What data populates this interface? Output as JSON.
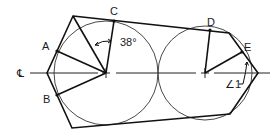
{
  "diagram": {
    "type": "geometric construction — polygon tangent to two circles",
    "centerline_symbol": "℄",
    "points": {
      "A": "A",
      "B": "B",
      "C": "C",
      "D": "D",
      "E": "E"
    },
    "angles": {
      "angle_c": "38°",
      "angle_1": "∠1"
    },
    "colors": {
      "line": "#111111",
      "circle": "#333333",
      "background": "#ffffff"
    }
  }
}
